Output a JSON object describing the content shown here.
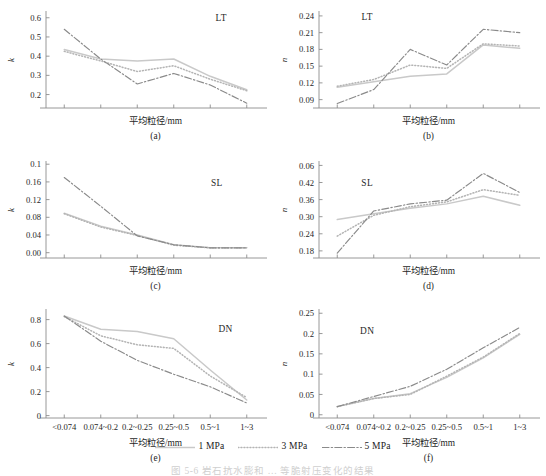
{
  "figure": {
    "caption": "图 5-6   岩石抗水膨和 … 等脆射压变化的结果",
    "xlabel": "平均粒径/mm",
    "categories": [
      "<0.074",
      "0.074~0.2",
      "0.2~0.25",
      "0.25~0.5",
      "0.5~1",
      "1~3"
    ]
  },
  "legend": {
    "position": "bottom-center",
    "items": [
      {
        "label": "1 MPa",
        "color": "#c9c9c9",
        "style": "solid"
      },
      {
        "label": "3 MPa",
        "color": "#b4b4b4",
        "style": "dotted"
      },
      {
        "label": "5 MPa",
        "color": "#8a8a8a",
        "style": "dashdot"
      }
    ]
  },
  "chart_data": [
    {
      "id": "a",
      "tag": "(a)",
      "type": "line",
      "title": "LT",
      "xlabel": "平均粒径/mm",
      "ylabel": "k",
      "x": [
        "<0.074",
        "0.074~0.2",
        "0.2~0.25",
        "0.25~0.5",
        "0.5~1",
        "1~3"
      ],
      "yticks": [
        0.2,
        0.3,
        0.4,
        0.5,
        0.6
      ],
      "ylim": [
        0.13,
        0.63
      ],
      "grid": false,
      "series": [
        {
          "name": "1 MPa",
          "values": [
            0.435,
            0.385,
            0.375,
            0.385,
            0.295,
            0.225
          ]
        },
        {
          "name": "3 MPa",
          "values": [
            0.425,
            0.375,
            0.32,
            0.35,
            0.28,
            0.22
          ]
        },
        {
          "name": "5 MPa",
          "values": [
            0.54,
            0.385,
            0.255,
            0.31,
            0.25,
            0.155
          ]
        }
      ]
    },
    {
      "id": "b",
      "tag": "(b)",
      "type": "line",
      "title": "LT",
      "xlabel": "平均粒径/mm",
      "ylabel": "n",
      "x": [
        "<0.074",
        "0.074~0.2",
        "0.2~0.25",
        "0.25~0.5",
        "0.5~1",
        "1~3"
      ],
      "yticks": [
        0.09,
        0.12,
        0.15,
        0.18,
        0.21,
        0.24
      ],
      "ylim": [
        0.075,
        0.247
      ],
      "grid": false,
      "series": [
        {
          "name": "1 MPa",
          "values": [
            0.112,
            0.122,
            0.132,
            0.136,
            0.188,
            0.182
          ]
        },
        {
          "name": "3 MPa",
          "values": [
            0.114,
            0.126,
            0.152,
            0.146,
            0.19,
            0.186
          ]
        },
        {
          "name": "5 MPa",
          "values": [
            0.083,
            0.108,
            0.18,
            0.152,
            0.216,
            0.21
          ]
        }
      ]
    },
    {
      "id": "c",
      "tag": "(c)",
      "type": "line",
      "title": "SL",
      "xlabel": "平均粒径/mm",
      "ylabel": "k",
      "x": [
        "<0.074",
        "0.074~0.2",
        "0.2~0.25",
        "0.25~0.5",
        "0.5~1",
        "1~3"
      ],
      "yticks": [
        0.0,
        0.04,
        0.08,
        0.12,
        0.16,
        0.2
      ],
      "yticklabels": [
        "0.00",
        "0.04",
        "0.08",
        "0.12",
        "0.16",
        "0.1"
      ],
      "ylim": [
        -0.012,
        0.205
      ],
      "grid": false,
      "series": [
        {
          "name": "1 MPa",
          "values": [
            0.089,
            0.06,
            0.04,
            0.018,
            0.011,
            0.011
          ]
        },
        {
          "name": "3 MPa",
          "values": [
            0.088,
            0.058,
            0.039,
            0.017,
            0.011,
            0.011
          ]
        },
        {
          "name": "5 MPa",
          "values": [
            0.17,
            0.105,
            0.038,
            0.018,
            0.011,
            0.011
          ]
        }
      ]
    },
    {
      "id": "d",
      "tag": "(d)",
      "type": "line",
      "title": "SL",
      "xlabel": "平均粒径/mm",
      "ylabel": "n",
      "x": [
        "<0.074",
        "0.074~0.2",
        "0.2~0.25",
        "0.25~0.5",
        "0.5~1",
        "1~3"
      ],
      "yticks": [
        0.18,
        0.24,
        0.3,
        0.36,
        0.42,
        0.48
      ],
      "yticklabels": [
        "0.18",
        "0.24",
        "0.30",
        "0.36",
        "0.42",
        "0.06"
      ],
      "ylim": [
        0.155,
        0.492
      ],
      "grid": false,
      "series": [
        {
          "name": "1 MPa",
          "values": [
            0.29,
            0.31,
            0.33,
            0.345,
            0.372,
            0.34
          ]
        },
        {
          "name": "3 MPa",
          "values": [
            0.232,
            0.305,
            0.335,
            0.352,
            0.395,
            0.375
          ]
        },
        {
          "name": "5 MPa",
          "values": [
            0.172,
            0.32,
            0.345,
            0.358,
            0.452,
            0.385
          ]
        }
      ]
    },
    {
      "id": "e",
      "tag": "(e)",
      "type": "line",
      "title": "DN",
      "xlabel": "平均粒径/mm",
      "ylabel": "k",
      "x": [
        "<0.074",
        "0.074~0.2",
        "0.2~0.25",
        "0.25~0.5",
        "0.5~1",
        "1~3"
      ],
      "yticks": [
        0.0,
        0.2,
        0.4,
        0.6,
        0.8
      ],
      "ylim": [
        -0.02,
        0.88
      ],
      "grid": false,
      "series": [
        {
          "name": "1 MPa",
          "values": [
            0.83,
            0.72,
            0.7,
            0.64,
            0.38,
            0.13
          ]
        },
        {
          "name": "3 MPa",
          "values": [
            0.825,
            0.665,
            0.59,
            0.56,
            0.33,
            0.15
          ]
        },
        {
          "name": "5 MPa",
          "values": [
            0.83,
            0.62,
            0.46,
            0.345,
            0.24,
            0.105
          ]
        }
      ]
    },
    {
      "id": "f",
      "tag": "(f)",
      "type": "line",
      "title": "DN",
      "xlabel": "平均粒径/mm",
      "ylabel": "n",
      "x": [
        "<0.074",
        "0.074~0.2",
        "0.2~0.25",
        "0.25~0.5",
        "0.5~1",
        "1~3"
      ],
      "yticks": [
        0.0,
        0.05,
        0.1,
        0.15,
        0.2,
        0.25
      ],
      "ylim": [
        -0.008,
        0.258
      ],
      "grid": false,
      "series": [
        {
          "name": "1 MPa",
          "values": [
            0.02,
            0.04,
            0.052,
            0.092,
            0.14,
            0.198
          ]
        },
        {
          "name": "3 MPa",
          "values": [
            0.02,
            0.04,
            0.05,
            0.095,
            0.142,
            0.2
          ]
        },
        {
          "name": "5 MPa",
          "values": [
            0.02,
            0.045,
            0.07,
            0.112,
            0.165,
            0.215
          ]
        }
      ]
    }
  ]
}
